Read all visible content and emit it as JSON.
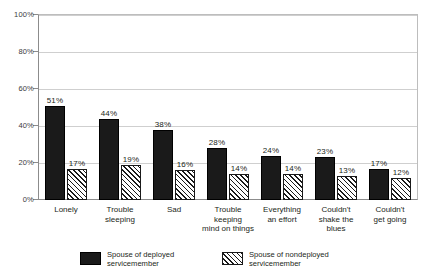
{
  "chart_data": {
    "type": "bar",
    "title": "",
    "subtitle": "",
    "xlabel": "",
    "ylabel": "",
    "ylim": [
      0,
      100
    ],
    "grid": true,
    "legend_position": "bottom",
    "categories": [
      "Lonely",
      "Trouble\nsleeping",
      "Sad",
      "Trouble\nkeeping\nmind on things",
      "Everything\nan effort",
      "Couldn't\nshake the\nblues",
      "Couldn't\nget going"
    ],
    "ytick_labels": [
      "0%",
      "20%",
      "40%",
      "60%",
      "80%",
      "100%"
    ],
    "ytick_values": [
      0,
      20,
      40,
      60,
      80,
      100
    ],
    "series": [
      {
        "name": "Spouse of deployed\nservicemember",
        "pattern": "solid",
        "color": "#1a1a1a",
        "values": [
          51,
          44,
          38,
          28,
          24,
          23,
          17
        ],
        "value_labels": [
          "51%",
          "44%",
          "38%",
          "28%",
          "24%",
          "23%",
          "17%"
        ]
      },
      {
        "name": "Spouse of nondeployed\nservicemember",
        "pattern": "hatched",
        "color": "#ffffff",
        "values": [
          17,
          19,
          16,
          14,
          14,
          13,
          12
        ],
        "value_labels": [
          "17%",
          "19%",
          "16%",
          "14%",
          "14%",
          "13%",
          "12%"
        ]
      }
    ]
  },
  "colors": {
    "background": "#ffffff",
    "axis": "#8c8c8c",
    "grid": "#cfcfcf",
    "text": "#231f20",
    "series_solid": "#1a1a1a",
    "series_hatched": "#ffffff"
  }
}
